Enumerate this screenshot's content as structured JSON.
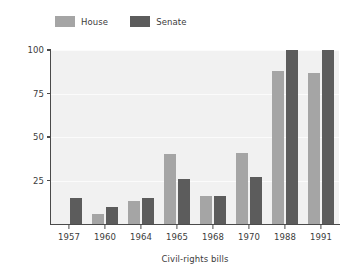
{
  "chart_data": {
    "type": "bar",
    "title": "",
    "xlabel": "Civil-rights bills",
    "ylabel": "Percentage supporting bill",
    "categories": [
      "1957",
      "1960",
      "1964",
      "1965",
      "1968",
      "1970",
      "1988",
      "1991"
    ],
    "series": [
      {
        "name": "House",
        "color": "#a5a5a5",
        "values": [
          null,
          6,
          13,
          40,
          16,
          41,
          88,
          87
        ]
      },
      {
        "name": "Senate",
        "color": "#5c5c5c",
        "values": [
          15,
          10,
          15,
          26,
          16,
          27,
          100,
          100
        ]
      }
    ],
    "ylim": [
      0,
      100
    ],
    "yticks": [
      25,
      50,
      75,
      100
    ],
    "ytick_labels": [
      "25",
      "50",
      "75",
      "100"
    ],
    "grid": true,
    "grid_axis": "y",
    "legend_position": "top-left",
    "plot_background": "#f1f1f1",
    "gridline_color": "#fbfbfb",
    "axis_color": "#4a4a4a",
    "text_color": "#3c3c3c"
  },
  "legend": {
    "entries": [
      {
        "label": "House",
        "color": "#a5a5a5"
      },
      {
        "label": "Senate",
        "color": "#5c5c5c"
      }
    ]
  }
}
